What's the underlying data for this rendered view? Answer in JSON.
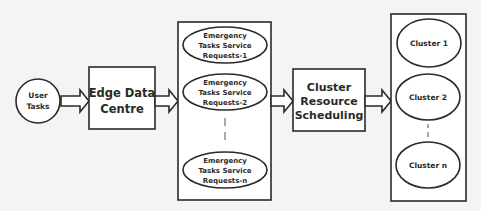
{
  "diagram": {
    "user_tasks": {
      "line1": "User",
      "line2": "Tasks"
    },
    "edge_data_centre": {
      "line1": "Edge Data",
      "line2": "Centre"
    },
    "requests_group": {
      "items": [
        {
          "line1": "Emergency",
          "line2": "Tasks Service",
          "line3": "Requests-1"
        },
        {
          "line1": "Emergency",
          "line2": "Tasks Service",
          "line3": "Requests-2"
        },
        {
          "line1": "Emergency",
          "line2": "Tasks Service",
          "line3": "Requests-n"
        }
      ]
    },
    "cluster_resource_scheduling": {
      "line1": "Cluster",
      "line2": "Resource",
      "line3": "Scheduling"
    },
    "clusters_group": {
      "items": [
        {
          "label": "Cluster 1"
        },
        {
          "label": "Cluster 2"
        },
        {
          "label": "Cluster n"
        }
      ]
    },
    "colors": {
      "stroke": "#2a2a2a",
      "fill": "#ffffff",
      "background": "#f4f4f2"
    }
  }
}
